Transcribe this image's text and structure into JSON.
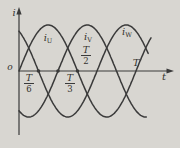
{
  "figure": {
    "background_color": "#d8d6d1",
    "ink_color": "#3a3a3a"
  },
  "chart_data": {
    "type": "line",
    "xlabel": "t",
    "ylabel": "i",
    "origin_label": "o",
    "grid": false,
    "legend_position": "on-curve",
    "amplitude": 1,
    "ylim": [
      -1,
      1
    ],
    "xlim_periods": [
      0,
      1.3
    ],
    "series": [
      {
        "name": "i_U",
        "label_base": "i",
        "label_sub": "U",
        "phase_deg": 0,
        "draw_start_periods": 0,
        "draw_end_periods": 1.13
      },
      {
        "name": "i_V",
        "label_base": "i",
        "label_sub": "V",
        "phase_deg": -120,
        "draw_start_periods": 0,
        "draw_end_periods": 1.09
      },
      {
        "name": "i_W",
        "label_base": "i",
        "label_sub": "W",
        "phase_deg": 120,
        "draw_start_periods": 0,
        "draw_end_periods": 1.11
      }
    ],
    "x_ticks": [
      {
        "numerator": "T",
        "denominator": "6",
        "fraction": 0.1667,
        "dot": true,
        "side": "below"
      },
      {
        "numerator": "T",
        "denominator": "3",
        "fraction": 0.3333,
        "dot": true,
        "side": "below"
      },
      {
        "numerator": "T",
        "denominator": "2",
        "fraction": 0.5,
        "dot": true,
        "side": "above"
      },
      {
        "numerator": "T",
        "denominator": "",
        "fraction": 1,
        "dot": false,
        "side": "above"
      }
    ]
  }
}
